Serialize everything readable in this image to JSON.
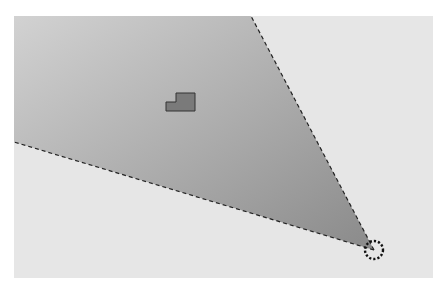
{
  "scene": {
    "background_color": "#e6e6e6",
    "cone_color": "#8f8f8f",
    "outline_color": "#222222"
  },
  "viewer": {
    "name": "view-origin-marker",
    "x": 374,
    "y": 250,
    "radius": 9
  },
  "cone": {
    "apex": [
      374,
      250
    ],
    "edge_left_end": [
      14,
      142
    ],
    "edge_top_end": [
      251,
      16
    ]
  },
  "object": {
    "name": "target-block",
    "x": 166,
    "y": 93
  }
}
